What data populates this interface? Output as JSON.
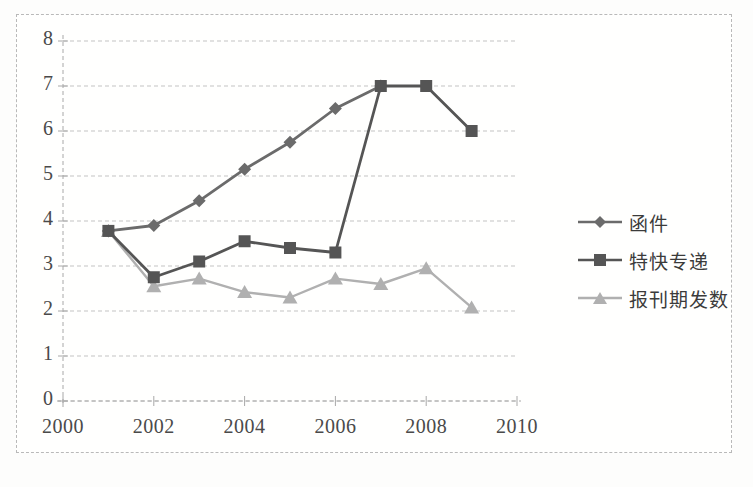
{
  "chart_data": {
    "type": "line",
    "title": "",
    "subtitle": "",
    "xlabel": "",
    "ylabel": "",
    "x": [
      2001,
      2002,
      2003,
      2004,
      2005,
      2006,
      2007,
      2008,
      2009
    ],
    "xlim": [
      2000,
      2010
    ],
    "ylim": [
      0,
      8
    ],
    "ytick_labels": [
      "0",
      "1",
      "2",
      "3",
      "4",
      "5",
      "6",
      "7",
      "8"
    ],
    "yticks": [
      0,
      1,
      2,
      3,
      4,
      5,
      6,
      7,
      8
    ],
    "xtick_labels": [
      "2000",
      "2002",
      "2004",
      "2006",
      "2008",
      "2010"
    ],
    "xticks": [
      2000,
      2002,
      2004,
      2006,
      2008,
      2010
    ],
    "grid": true,
    "grid_style": "dashed-horizontal",
    "legend_position": "right",
    "series": [
      {
        "name": "函件",
        "marker": "diamond",
        "color": "#6b6b6b",
        "x": [
          2001,
          2002,
          2003,
          2004,
          2005,
          2006,
          2007
        ],
        "values": [
          3.78,
          3.9,
          4.45,
          5.15,
          5.75,
          6.5,
          7.0
        ]
      },
      {
        "name": "特快专递",
        "marker": "square",
        "color": "#555555",
        "x": [
          2001,
          2002,
          2003,
          2004,
          2005,
          2006,
          2007,
          2008,
          2009
        ],
        "values": [
          3.78,
          2.75,
          3.1,
          3.55,
          3.4,
          3.3,
          7.0,
          7.0,
          6.0
        ]
      },
      {
        "name": "报刊期发数",
        "marker": "triangle",
        "color": "#b0b0b0",
        "x": [
          2001,
          2002,
          2003,
          2004,
          2005,
          2006,
          2007,
          2008,
          2009
        ],
        "values": [
          3.78,
          2.55,
          2.72,
          2.42,
          2.3,
          2.72,
          2.6,
          2.95,
          2.08
        ]
      }
    ]
  },
  "axes": {
    "y_labels": [
      "8",
      "7",
      "6",
      "5",
      "4",
      "3",
      "2",
      "1",
      "0"
    ],
    "x_labels": [
      "2000",
      "2002",
      "2004",
      "2006",
      "2008",
      "2010"
    ]
  },
  "legend": {
    "items": [
      {
        "label": "函件",
        "marker": "diamond-marker-icon"
      },
      {
        "label": "特快专递",
        "marker": "square-marker-icon"
      },
      {
        "label": "报刊期发数",
        "marker": "triangle-marker-icon"
      }
    ]
  },
  "caption": {
    "text": ""
  },
  "colors": {
    "series_1": "#6b6b6b",
    "series_2": "#555555",
    "series_3": "#b0b0b0",
    "grid": "#c3c3c3",
    "axis": "#a8a8a8",
    "frame": "#b9b9b9",
    "text": "#4a4a4a"
  }
}
